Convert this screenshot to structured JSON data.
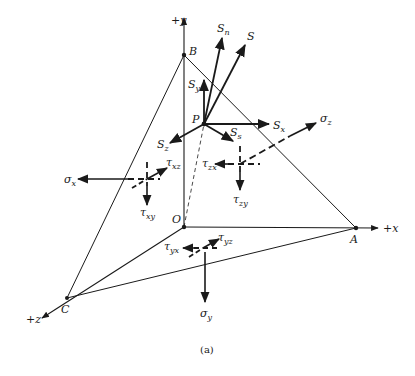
{
  "figure": {
    "caption": "(a)",
    "points": {
      "O": {
        "label": "O",
        "x": 184,
        "y": 227
      },
      "A": {
        "label": "A",
        "x": 356,
        "y": 228
      },
      "B": {
        "label": "B",
        "x": 184,
        "y": 55
      },
      "C": {
        "label": "C",
        "x": 67,
        "y": 298
      },
      "P": {
        "label": "P",
        "x": 204,
        "y": 124
      }
    },
    "axes": {
      "x": {
        "label": "+x"
      },
      "y": {
        "label": "+y"
      },
      "z": {
        "label": "+z"
      }
    },
    "vectors": {
      "S": {
        "label": "S"
      },
      "Sn": {
        "label": "S",
        "sub": "n"
      },
      "Sx": {
        "label": "S",
        "sub": "x"
      },
      "Sy": {
        "label": "S",
        "sub": "y"
      },
      "Sz": {
        "label": "S",
        "sub": "z"
      },
      "Ss": {
        "label": "S",
        "sub": "s"
      }
    },
    "stresses": {
      "sigma_x": {
        "label": "σ",
        "sub": "x"
      },
      "sigma_y": {
        "label": "σ",
        "sub": "y"
      },
      "sigma_z": {
        "label": "σ",
        "sub": "z"
      },
      "tau_xy": {
        "label": "τ",
        "sub": "xy"
      },
      "tau_xz": {
        "label": "τ",
        "sub": "xz"
      },
      "tau_yx": {
        "label": "τ",
        "sub": "yx"
      },
      "tau_yz": {
        "label": "τ",
        "sub": "yz"
      },
      "tau_zx": {
        "label": "τ",
        "sub": "zx"
      },
      "tau_zy": {
        "label": "τ",
        "sub": "zy"
      }
    },
    "colors": {
      "ink": "#1a1a1a",
      "background": "#ffffff"
    }
  }
}
